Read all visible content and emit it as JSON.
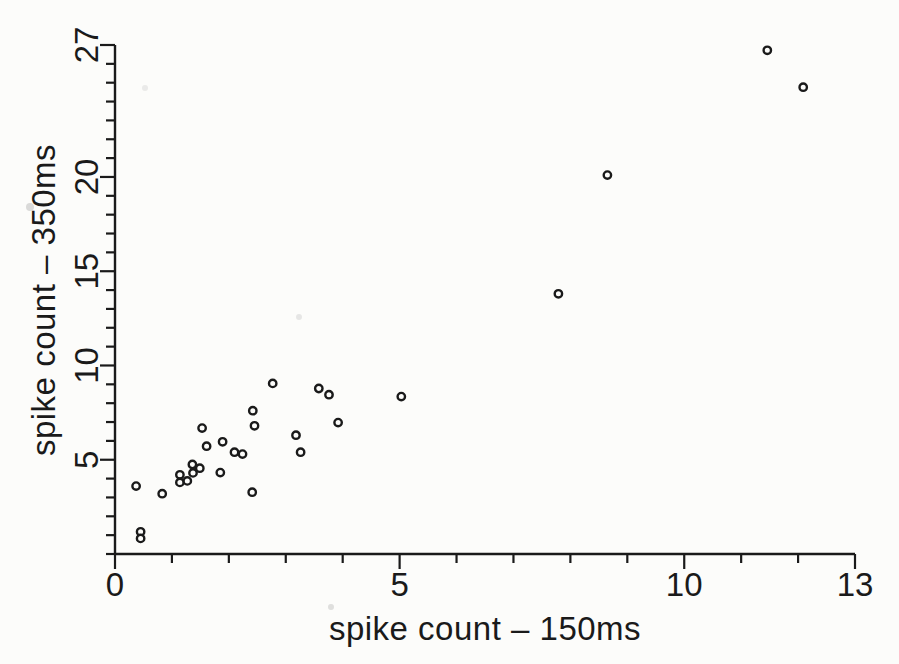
{
  "figure": {
    "background": "#fcfcfa",
    "ink": "#1a1a1a"
  },
  "chart_data": {
    "type": "scatter",
    "title": "",
    "xlabel": "spike count – 150ms",
    "ylabel": "spike count – 350ms",
    "xlim": [
      0,
      13
    ],
    "ylim": [
      0,
      27
    ],
    "x_labeled_ticks": [
      0,
      5,
      10,
      13
    ],
    "y_labeled_ticks": [
      5,
      10,
      15,
      20,
      27
    ],
    "x_minor_tick_step": 1,
    "y_minor_tick_step": 1,
    "grid": false,
    "legend": "none",
    "marker": {
      "shape": "open-circle",
      "radius_px": 3.7,
      "stroke_px": 2.4,
      "fill": "#fcfcfa"
    },
    "points": [
      [
        0.37,
        3.6
      ],
      [
        0.45,
        1.18
      ],
      [
        0.45,
        0.83
      ],
      [
        0.83,
        3.2
      ],
      [
        1.14,
        4.2
      ],
      [
        1.14,
        3.8
      ],
      [
        1.27,
        3.88
      ],
      [
        1.37,
        4.3
      ],
      [
        1.36,
        4.75
      ],
      [
        1.49,
        4.55
      ],
      [
        1.53,
        6.68
      ],
      [
        1.61,
        5.72
      ],
      [
        1.85,
        4.32
      ],
      [
        1.89,
        5.95
      ],
      [
        2.1,
        5.4
      ],
      [
        2.24,
        5.3
      ],
      [
        2.42,
        7.6
      ],
      [
        2.45,
        6.8
      ],
      [
        2.41,
        3.28
      ],
      [
        2.77,
        9.05
      ],
      [
        3.18,
        6.3
      ],
      [
        3.26,
        5.4
      ],
      [
        3.58,
        8.78
      ],
      [
        3.76,
        8.45
      ],
      [
        3.92,
        6.97
      ],
      [
        5.03,
        8.35
      ],
      [
        7.79,
        13.8
      ],
      [
        8.65,
        20.1
      ],
      [
        11.46,
        26.72
      ],
      [
        12.09,
        24.76
      ]
    ]
  }
}
